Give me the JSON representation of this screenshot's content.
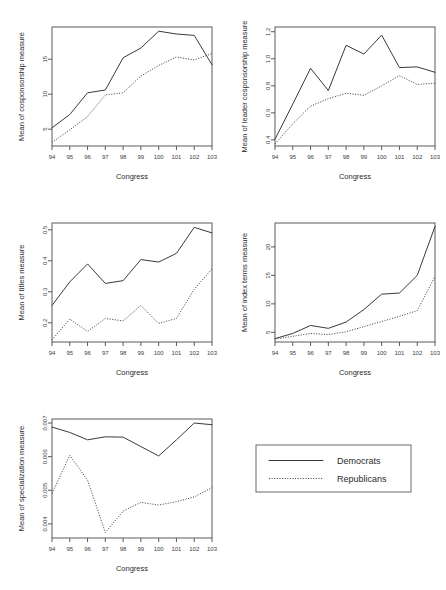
{
  "figure": {
    "width": 446,
    "height": 590,
    "background": "#ffffff",
    "ink_color": "#3a3a3a"
  },
  "legend": {
    "name": "series-legend",
    "entries": [
      {
        "label": "Democrats",
        "style": "solid"
      },
      {
        "label": "Republicans",
        "style": "dotted"
      }
    ]
  },
  "chart_data": [
    {
      "id": "cosponsorship",
      "type": "line",
      "title": "",
      "xlabel": "Congress",
      "ylabel": "Mean of cosponsorship measure",
      "categories": [
        "94",
        "95",
        "96",
        "97",
        "98",
        "99",
        "100",
        "101",
        "102",
        "103"
      ],
      "xticklabels": [
        "94",
        "95",
        "96",
        "97",
        "98",
        "99",
        "100",
        "101",
        "102",
        "103"
      ],
      "yticks": [
        5,
        10,
        15
      ],
      "yticklabels": [
        "5",
        "10",
        "15"
      ],
      "ylim": [
        2.6,
        19.6
      ],
      "grid": false,
      "legend_position": "external",
      "series": [
        {
          "name": "Democrats",
          "style": "solid",
          "values": [
            5.2,
            7.1,
            10.2,
            10.6,
            15.2,
            16.6,
            19.0,
            18.6,
            18.4,
            14.2
          ]
        },
        {
          "name": "Republicans",
          "style": "dotted",
          "values": [
            3.1,
            4.9,
            6.8,
            9.9,
            10.2,
            12.6,
            14.1,
            15.3,
            14.9,
            15.8
          ]
        }
      ]
    },
    {
      "id": "leader-cosponsorship",
      "type": "line",
      "title": "",
      "xlabel": "Congress",
      "ylabel": "Mean of leader cosponsorship measure",
      "categories": [
        "94",
        "95",
        "96",
        "97",
        "98",
        "99",
        "100",
        "101",
        "102",
        "103"
      ],
      "xticklabels": [
        "94",
        "95",
        "96",
        "97",
        "98",
        "99",
        "100",
        "101",
        "102",
        "103"
      ],
      "yticks": [
        0.4,
        0.6,
        0.8,
        1.0,
        1.2
      ],
      "yticklabels": [
        "0.4",
        "0.6",
        "0.8",
        "1.0",
        "1.2"
      ],
      "ylim": [
        0.355,
        1.235
      ],
      "grid": false,
      "legend_position": "external",
      "series": [
        {
          "name": "Democrats",
          "style": "solid",
          "values": [
            0.405,
            0.665,
            0.93,
            0.765,
            1.1,
            1.035,
            1.175,
            0.935,
            0.94,
            0.9
          ]
        },
        {
          "name": "Republicans",
          "style": "dotted",
          "values": [
            0.37,
            0.52,
            0.65,
            0.705,
            0.745,
            0.73,
            0.8,
            0.875,
            0.81,
            0.82
          ]
        }
      ]
    },
    {
      "id": "titles",
      "type": "line",
      "title": "",
      "xlabel": "Congress",
      "ylabel": "Mean of titles measure",
      "categories": [
        "94",
        "95",
        "96",
        "97",
        "98",
        "99",
        "100",
        "101",
        "102",
        "103"
      ],
      "xticklabels": [
        "94",
        "95",
        "96",
        "97",
        "98",
        "99",
        "100",
        "101",
        "102",
        "103"
      ],
      "yticks": [
        0.2,
        0.3,
        0.4,
        0.5
      ],
      "yticklabels": [
        "0.2",
        "0.3",
        "0.4",
        "0.5"
      ],
      "ylim": [
        0.138,
        0.522
      ],
      "grid": false,
      "legend_position": "external",
      "series": [
        {
          "name": "Democrats",
          "style": "solid",
          "values": [
            0.256,
            0.332,
            0.39,
            0.327,
            0.336,
            0.404,
            0.396,
            0.424,
            0.508,
            0.49
          ]
        },
        {
          "name": "Republicans",
          "style": "dotted",
          "values": [
            0.145,
            0.212,
            0.172,
            0.214,
            0.206,
            0.256,
            0.198,
            0.214,
            0.308,
            0.374
          ]
        }
      ]
    },
    {
      "id": "index-terms",
      "type": "line",
      "title": "",
      "xlabel": "Congress",
      "ylabel": "Mean of index terms measure",
      "categories": [
        "94",
        "95",
        "96",
        "97",
        "98",
        "99",
        "100",
        "101",
        "102",
        "103"
      ],
      "xticklabels": [
        "94",
        "95",
        "96",
        "97",
        "98",
        "99",
        "100",
        "101",
        "102",
        "103"
      ],
      "yticks": [
        5,
        10,
        15,
        20
      ],
      "yticklabels": [
        "5",
        "10",
        "15",
        "20"
      ],
      "ylim": [
        3.3,
        24.2
      ],
      "grid": false,
      "legend_position": "external",
      "series": [
        {
          "name": "Democrats",
          "style": "solid",
          "values": [
            3.9,
            4.8,
            6.2,
            5.7,
            6.8,
            9.0,
            11.7,
            11.9,
            15.0,
            23.6
          ]
        },
        {
          "name": "Republicans",
          "style": "dotted",
          "values": [
            3.8,
            4.3,
            4.8,
            4.6,
            5.1,
            6.0,
            6.9,
            7.8,
            8.8,
            14.8
          ]
        }
      ]
    },
    {
      "id": "specialization",
      "type": "line",
      "title": "",
      "xlabel": "Congress",
      "ylabel": "Mean of specialization measure",
      "categories": [
        "94",
        "95",
        "96",
        "97",
        "98",
        "99",
        "100",
        "101",
        "102",
        "103"
      ],
      "xticklabels": [
        "94",
        "95",
        "96",
        "97",
        "98",
        "99",
        "100",
        "101",
        "102",
        "103"
      ],
      "yticks": [
        0.004,
        0.005,
        0.006,
        0.007
      ],
      "yticklabels": [
        "0.004",
        "0.005",
        "0.006",
        "0.007"
      ],
      "ylim": [
        0.00358,
        0.00712
      ],
      "grid": false,
      "legend_position": "external",
      "series": [
        {
          "name": "Democrats",
          "style": "solid",
          "values": [
            0.00688,
            0.00672,
            0.0065,
            0.00659,
            0.00658,
            0.0063,
            0.00602,
            0.0065,
            0.007,
            0.00695
          ]
        },
        {
          "name": "Republicans",
          "style": "dotted",
          "values": [
            0.00491,
            0.00604,
            0.0053,
            0.00374,
            0.00438,
            0.00464,
            0.00456,
            0.00466,
            0.0048,
            0.00508
          ]
        }
      ]
    }
  ]
}
